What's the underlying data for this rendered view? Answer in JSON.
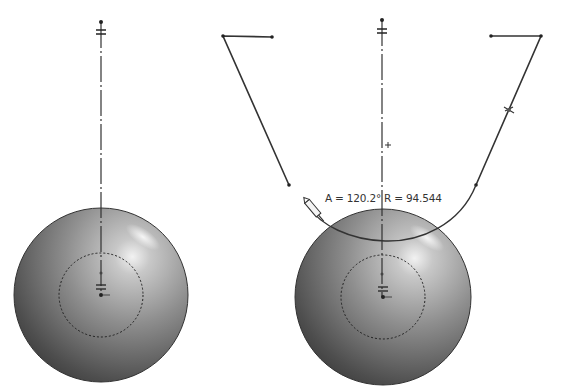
{
  "viewport": {
    "background": "#ffffff",
    "line_color": "#3a3a3a",
    "sphere_light": "#e6e6e6",
    "sphere_mid": "#8c8c8c",
    "sphere_dark": "#3c3c3c"
  },
  "left_view": {
    "sphere": {
      "cx": 101,
      "cy": 295,
      "r": 87
    },
    "inner_circle": {
      "cx": 101,
      "cy": 295,
      "r": 42,
      "style": "dashed"
    },
    "centerline": {
      "x": 101,
      "y1": 22,
      "y2": 295
    },
    "sketch_polyline": [
      [
        272,
        37
      ],
      [
        223,
        36
      ],
      [
        289,
        185
      ]
    ],
    "icons": [
      "equal-constraint-icon",
      "vertical-constraint-icon",
      "origin-icon"
    ]
  },
  "right_view": {
    "sphere": {
      "cx": 383,
      "cy": 297,
      "r": 88
    },
    "inner_circle": {
      "cx": 383,
      "cy": 297,
      "r": 42,
      "style": "dashed"
    },
    "centerline": {
      "x": 382,
      "y1": 20,
      "y2": 297
    },
    "sketch_polyline": [
      [
        491,
        36
      ],
      [
        541,
        36
      ],
      [
        476,
        185
      ]
    ],
    "arc": {
      "start": [
        476,
        185
      ],
      "end": [
        310,
        206
      ]
    },
    "tangent_marker": {
      "x": 509,
      "y": 110
    },
    "pencil_cursor": {
      "x": 316,
      "y": 212
    },
    "dimension_readout": "A = 120.2° R = 94.544",
    "icons": [
      "equal-constraint-icon",
      "vertical-constraint-icon",
      "origin-icon",
      "tangent-icon",
      "pencil-cursor-icon"
    ]
  }
}
